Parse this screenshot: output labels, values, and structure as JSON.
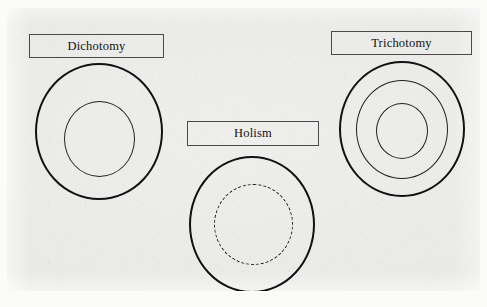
{
  "figure": {
    "kind": "concentric-circle-diagram",
    "panel_background": "#e9e9e7",
    "page_background": "#fbfbfa",
    "stroke_color": "#111111",
    "label_border_color": "#4a4a4a",
    "text_color": "#14120f"
  },
  "diagrams": [
    {
      "id": "dichotomy",
      "label": "Dichotomy",
      "ring_count": 2,
      "rings": [
        {
          "name": "outer-ring",
          "style": "solid",
          "weight": "thick"
        },
        {
          "name": "inner-ring",
          "style": "solid",
          "weight": "thin"
        }
      ]
    },
    {
      "id": "holism",
      "label": "Holism",
      "ring_count": 2,
      "rings": [
        {
          "name": "outer-ring",
          "style": "solid",
          "weight": "thick"
        },
        {
          "name": "inner-ring",
          "style": "dashed",
          "weight": "thin"
        }
      ]
    },
    {
      "id": "trichotomy",
      "label": "Trichotomy",
      "ring_count": 3,
      "rings": [
        {
          "name": "outer-ring",
          "style": "solid",
          "weight": "thick"
        },
        {
          "name": "middle-ring",
          "style": "solid",
          "weight": "thin"
        },
        {
          "name": "inner-ring",
          "style": "solid",
          "weight": "thin"
        }
      ]
    }
  ]
}
